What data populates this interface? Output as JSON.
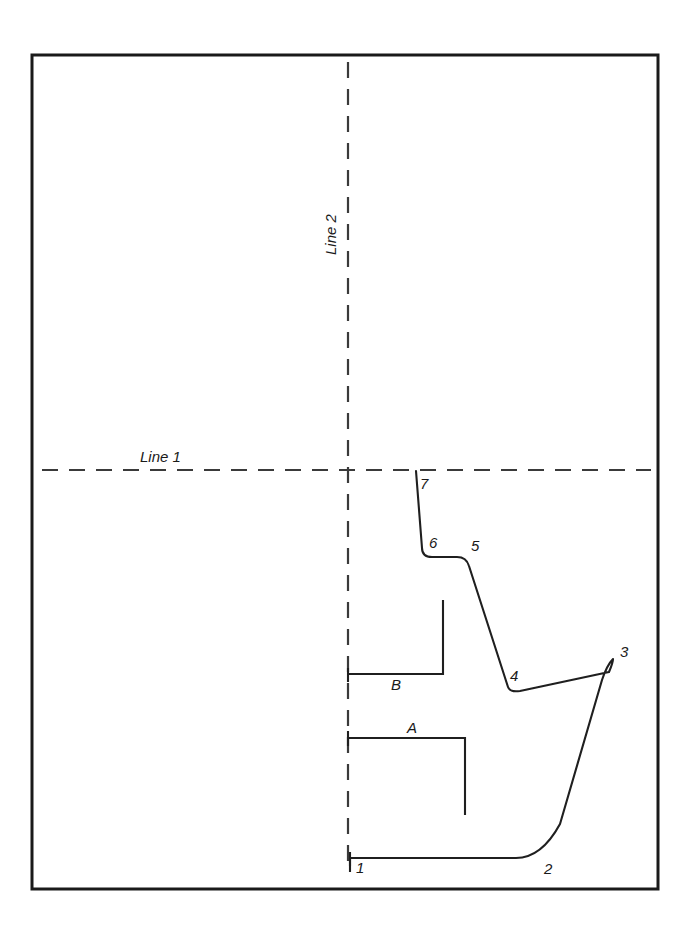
{
  "figure": {
    "type": "technical-line-diagram",
    "background_color": "#ffffff",
    "ink_color": "#1a1a1a",
    "dash_color": "#3a3a3a",
    "frame": {
      "x": 32,
      "y": 55,
      "width": 626,
      "height": 834
    }
  },
  "axes": [
    {
      "id": "line1",
      "label": "Line 1",
      "orientation": "horizontal",
      "style": "dashed",
      "y": 470,
      "x_start": 42,
      "x_end": 651,
      "label_x": 140,
      "label_y": 462
    },
    {
      "id": "line2",
      "label": "Line 2",
      "orientation": "vertical",
      "style": "dashed",
      "x": 348,
      "y_start": 62,
      "y_end": 866,
      "label_x": 336,
      "label_y": 255,
      "label_rotation": -90
    }
  ],
  "profile": {
    "name": "section-profile",
    "path": "M 350 866 L 350 858 L 516 858 C 534 858 548 846 560 824 L 602 680 C 607 665 612 660 613 659 C 613 660 612 665 609 672 L 520 691 C 513 692 509 690 508 687 L 469 566 C 467 559 463 557 457 557 L 432 557 C 426 557 422 554 422 548 L 416 471",
    "points": [
      {
        "id": "1",
        "label": "1",
        "x": 350,
        "y": 866,
        "label_x": 356,
        "label_y": 873
      },
      {
        "id": "2",
        "label": "2",
        "x": 535,
        "y": 858,
        "label_x": 544,
        "label_y": 874
      },
      {
        "id": "3",
        "label": "3",
        "x": 613,
        "y": 659,
        "label_x": 620,
        "label_y": 657
      },
      {
        "id": "4",
        "label": "4",
        "x": 508,
        "y": 687,
        "label_x": 510,
        "label_y": 681
      },
      {
        "id": "5",
        "label": "5",
        "x": 469,
        "y": 557,
        "label_x": 471,
        "label_y": 551
      },
      {
        "id": "6",
        "label": "6",
        "x": 428,
        "y": 553,
        "label_x": 429,
        "label_y": 548
      },
      {
        "id": "7",
        "label": "7",
        "x": 416,
        "y": 471,
        "label_x": 420,
        "label_y": 489
      }
    ],
    "start_tick": {
      "x": 350,
      "y_top": 852,
      "y_bottom": 872
    }
  },
  "regions": [
    {
      "id": "region-b",
      "label": "B",
      "path": "M 443 600 L 443 674 L 348 674",
      "end_tick": {
        "x": 348,
        "y_top": 668,
        "y_bottom": 682
      },
      "label_x": 391,
      "label_y": 690
    },
    {
      "id": "region-a",
      "label": "A",
      "path": "M 348 738 L 465 738 L 465 815",
      "end_tick": {
        "x": 348,
        "y_top": 731,
        "y_bottom": 746
      },
      "label_x": 407,
      "label_y": 733
    }
  ]
}
